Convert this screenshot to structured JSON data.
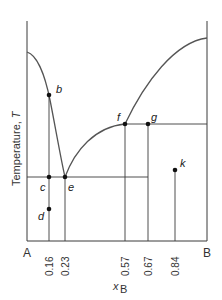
{
  "diagram": {
    "type": "binary phase diagram (eutectic)",
    "y_axis_title": "Temperature, ",
    "y_axis_symbol": "T",
    "x_axis_symbol": "x",
    "x_axis_subscript": "B",
    "left_end_label": "A",
    "right_end_label": "B",
    "tick_labels": [
      "0.16",
      "0.23",
      "0.57",
      "0.67",
      "0.84"
    ],
    "points": [
      {
        "label": "b",
        "x_B": 0.16
      },
      {
        "label": "c",
        "x_B": 0.16
      },
      {
        "label": "d",
        "x_B": 0.16
      },
      {
        "label": "e",
        "x_B": 0.23
      },
      {
        "label": "f",
        "x_B": 0.57
      },
      {
        "label": "g",
        "x_B": 0.67
      },
      {
        "label": "k",
        "x_B": 0.84
      }
    ],
    "colors": {
      "curve": "#555555",
      "lines": "#3a3a3a",
      "points": "#111111"
    }
  }
}
